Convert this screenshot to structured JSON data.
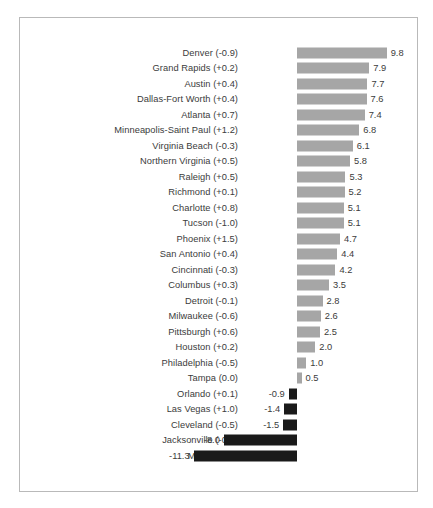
{
  "chart_data": {
    "type": "bar",
    "title": "",
    "subtitle": "",
    "xlabel": "",
    "ylabel": "",
    "orientation": "horizontal",
    "grid": false,
    "legend": null,
    "xlim": [
      -11.3,
      9.8
    ],
    "zero_axis": true,
    "colors": {
      "positive": "#a6a6a6",
      "negative": "#1a1a1a",
      "frame": "#b9b9b9",
      "text": "#3b3b3b"
    },
    "categories": [
      "Denver (-0.9)",
      "Grand Rapids (+0.2)",
      "Austin (+0.4)",
      "Dallas-Fort Worth (+0.4)",
      "Atlanta (+0.7)",
      "Minneapolis-Saint Paul (+1.2)",
      "Virginia Beach (-0.3)",
      "Northern Virginia (+0.5)",
      "Raleigh (+0.5)",
      "Richmond (+0.1)",
      "Charlotte (+0.8)",
      "Tucson (-1.0)",
      "Phoenix (+1.5)",
      "San Antonio (+0.4)",
      "Cincinnati (-0.3)",
      "Columbus (+0.3)",
      "Detroit (-0.1)",
      "Milwaukee (-0.6)",
      "Pittsburgh (+0.6)",
      "Houston (+0.2)",
      "Philadelphia (-0.5)",
      "Tampa (0.0)",
      "Orlando (+0.1)",
      "Las Vegas (+1.0)",
      "Cleveland (-0.5)",
      "Jacksonville (-0.1)",
      "Miami (-0.3)"
    ],
    "values": [
      9.8,
      7.9,
      7.7,
      7.6,
      7.4,
      6.8,
      6.1,
      5.8,
      5.3,
      5.2,
      5.1,
      5.1,
      4.7,
      4.4,
      4.2,
      3.5,
      2.8,
      2.6,
      2.5,
      2.0,
      1.0,
      0.5,
      -0.9,
      -1.4,
      -1.5,
      -8.0,
      -11.3
    ],
    "value_labels": [
      "9.8",
      "7.9",
      "7.7",
      "7.6",
      "7.4",
      "6.8",
      "6.1",
      "5.8",
      "5.3",
      "5.2",
      "5.1",
      "5.1",
      "4.7",
      "4.4",
      "4.2",
      "3.5",
      "2.8",
      "2.6",
      "2.5",
      "2.0",
      "1.0",
      "0.5",
      "-0.9",
      "-1.4",
      "-1.5",
      "-8.0",
      "-11.3"
    ]
  },
  "caption": {
    "artifact_text": ""
  }
}
